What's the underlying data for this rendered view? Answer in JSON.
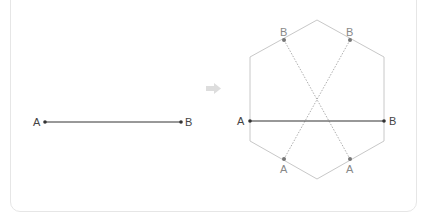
{
  "left_figure": {
    "point_a_label": "A",
    "point_b_label": "B"
  },
  "arrow": {
    "icon": "right-arrow-icon",
    "color": "#dddddd"
  },
  "right_figure": {
    "segment_a_label": "A",
    "segment_b_label": "B",
    "top_left_label": "B",
    "top_right_label": "B",
    "bottom_left_label": "A",
    "bottom_right_label": "A"
  },
  "colors": {
    "segment": "#333333",
    "hexagon": "#c8c8c8",
    "dotted": "#999999",
    "gray_label": "#888888",
    "dark_label": "#444444"
  }
}
